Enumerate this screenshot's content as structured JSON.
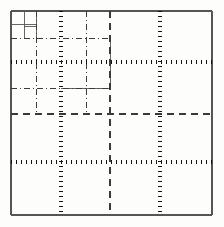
{
  "figure": {
    "width": 224,
    "height": 227,
    "background_color": "#fdfdfc",
    "ink_color": "#1a1a1a"
  },
  "chart_data": {
    "type": "diagram",
    "xlabel": "",
    "ylabel": "",
    "xlim": [
      11,
      212
    ],
    "ylim": [
      11,
      215
    ],
    "grid": true,
    "legend": "none",
    "domain_box": {
      "x0": 11,
      "y0": 11,
      "x1": 212,
      "y1": 215,
      "style": "solid",
      "stroke_width": 1.3,
      "color": "#555555"
    },
    "levels": [
      {
        "level": 1,
        "style": "dotted",
        "stroke_width": 3.4,
        "dash": "0.5 4.5",
        "color": "#111111",
        "verticals": [
          61,
          160
        ],
        "horizontals": [
          62,
          162
        ],
        "label": "level-1 split: thick dotted"
      },
      {
        "level": 2,
        "style": "dashed",
        "stroke_width": 1.1,
        "dash": "7 5",
        "color": "#3a3a3a",
        "verticals": [
          110
        ],
        "horizontals": [
          114
        ],
        "label": "level-2 split: dashed"
      },
      {
        "level": 3,
        "style": "dash-dot",
        "stroke_width": 1.0,
        "dash": "6 3 1 3",
        "color": "#3a3a3a",
        "verticals": [
          36,
          86
        ],
        "horizontals": [
          38,
          88
        ],
        "label": "level-3 split: dash-dot"
      },
      {
        "level": 4,
        "style": "solid-thin",
        "stroke_width": 0.9,
        "dash": "none",
        "color": "#555555",
        "verticals": [
          24,
          36
        ],
        "horizontals": [
          24,
          26
        ],
        "label": "level-4 split: fine solid"
      }
    ],
    "cells": [
      {
        "id": "c-1",
        "x0": 11,
        "y0": 11,
        "x1": 61,
        "y1": 62,
        "level": 1
      },
      {
        "id": "c-2",
        "x0": 61,
        "y0": 11,
        "x1": 160,
        "y1": 62,
        "level": 1
      },
      {
        "id": "c-3",
        "x0": 160,
        "y0": 11,
        "x1": 212,
        "y1": 62,
        "level": 1
      },
      {
        "id": "c-4",
        "x0": 11,
        "y0": 62,
        "x1": 61,
        "y1": 162,
        "level": 1
      },
      {
        "id": "c-5",
        "x0": 61,
        "y0": 62,
        "x1": 160,
        "y1": 162,
        "level": 1
      },
      {
        "id": "c-6",
        "x0": 160,
        "y0": 62,
        "x1": 212,
        "y1": 162,
        "level": 1
      },
      {
        "id": "c-7",
        "x0": 11,
        "y0": 162,
        "x1": 61,
        "y1": 215,
        "level": 1
      },
      {
        "id": "c-8",
        "x0": 61,
        "y0": 162,
        "x1": 160,
        "y1": 215,
        "level": 1
      },
      {
        "id": "c-9",
        "x0": 160,
        "y0": 162,
        "x1": 212,
        "y1": 215,
        "level": 1
      }
    ],
    "segments": [
      {
        "name": "border-top",
        "kind": "solid",
        "x1": 11,
        "y1": 11,
        "x2": 212,
        "y2": 11
      },
      {
        "name": "border-bottom",
        "kind": "solid",
        "x1": 11,
        "y1": 215,
        "x2": 212,
        "y2": 215
      },
      {
        "name": "border-left",
        "kind": "solid",
        "x1": 11,
        "y1": 11,
        "x2": 11,
        "y2": 215
      },
      {
        "name": "border-right",
        "kind": "solid",
        "x1": 212,
        "y1": 11,
        "x2": 212,
        "y2": 215
      },
      {
        "name": "dot-v-left",
        "kind": "dotted",
        "x1": 61,
        "y1": 11,
        "x2": 61,
        "y2": 215
      },
      {
        "name": "dot-v-right",
        "kind": "dotted",
        "x1": 160,
        "y1": 11,
        "x2": 160,
        "y2": 215
      },
      {
        "name": "dot-h-upper",
        "kind": "dotted",
        "x1": 11,
        "y1": 62,
        "x2": 212,
        "y2": 62
      },
      {
        "name": "dot-h-lower",
        "kind": "dotted",
        "x1": 11,
        "y1": 162,
        "x2": 212,
        "y2": 162
      },
      {
        "name": "dash-v-mid",
        "kind": "dashed",
        "x1": 110,
        "y1": 11,
        "x2": 110,
        "y2": 215
      },
      {
        "name": "dash-h-mid",
        "kind": "dashed",
        "x1": 11,
        "y1": 114,
        "x2": 212,
        "y2": 114
      },
      {
        "name": "dashdot-h-q1",
        "kind": "dash-dot",
        "x1": 11,
        "y1": 38,
        "x2": 110,
        "y2": 38
      },
      {
        "name": "dashdot-h-q3",
        "kind": "dash-dot",
        "x1": 11,
        "y1": 88,
        "x2": 110,
        "y2": 88
      },
      {
        "name": "dashdot-v-q1",
        "kind": "dash-dot",
        "x1": 36,
        "y1": 11,
        "x2": 36,
        "y2": 114
      },
      {
        "name": "dashdot-v-q3",
        "kind": "dash-dot",
        "x1": 86,
        "y1": 11,
        "x2": 86,
        "y2": 114
      },
      {
        "name": "fine-h-a",
        "kind": "solid-thin",
        "x1": 11,
        "y1": 24,
        "x2": 36,
        "y2": 24
      },
      {
        "name": "fine-v-a",
        "kind": "solid-thin",
        "x1": 24,
        "y1": 11,
        "x2": 24,
        "y2": 38
      },
      {
        "name": "fine-h-b",
        "kind": "solid-thin",
        "x1": 24,
        "y1": 26,
        "x2": 36,
        "y2": 26
      },
      {
        "name": "fine-v-b",
        "kind": "solid-thin",
        "x1": 36,
        "y1": 11,
        "x2": 36,
        "y2": 38
      },
      {
        "name": "fine-h-c",
        "kind": "solid-thin",
        "x1": 61,
        "y1": 88,
        "x2": 110,
        "y2": 88
      },
      {
        "name": "fine-v-c",
        "kind": "solid-thin",
        "x1": 110,
        "y1": 38,
        "x2": 110,
        "y2": 88
      }
    ]
  }
}
